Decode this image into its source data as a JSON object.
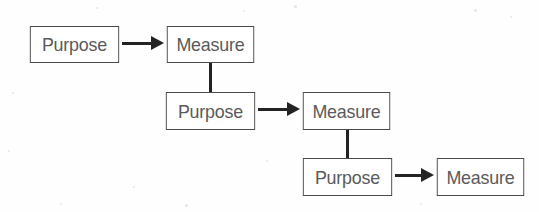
{
  "diagram": {
    "type": "flowchart",
    "colors": {
      "background": "#fefefe",
      "box_border": "#4a4a4a",
      "box_fill": "#ffffff",
      "text": "#5a5a5a",
      "connector": "#232323"
    },
    "nodes": [
      {
        "id": "purpose-1",
        "label": "Purpose",
        "row": 1,
        "x": 27,
        "y": 26,
        "w": 95,
        "h": 37
      },
      {
        "id": "measure-1",
        "label": "Measure",
        "row": 1,
        "x": 164,
        "y": 26,
        "w": 93,
        "h": 37
      },
      {
        "id": "purpose-2",
        "label": "Purpose",
        "row": 2,
        "x": 163,
        "y": 92,
        "w": 95,
        "h": 38
      },
      {
        "id": "measure-2",
        "label": "Measure",
        "row": 2,
        "x": 300,
        "y": 92,
        "w": 93,
        "h": 38
      },
      {
        "id": "purpose-3",
        "label": "Purpose",
        "row": 3,
        "x": 300,
        "y": 158,
        "w": 95,
        "h": 38
      },
      {
        "id": "measure-3",
        "label": "Measure",
        "row": 3,
        "x": 434,
        "y": 158,
        "w": 93,
        "h": 38
      }
    ],
    "connectors": [
      {
        "id": "arrow-purpose1-measure1",
        "kind": "arrow-right",
        "from": "purpose-1",
        "to": "measure-1",
        "x": 122,
        "y": 43,
        "length": 42
      },
      {
        "id": "link-measure1-purpose2",
        "kind": "line-vertical",
        "from": "measure-1",
        "to": "purpose-2",
        "x": 209,
        "y": 63,
        "length": 29
      },
      {
        "id": "arrow-purpose2-measure2",
        "kind": "arrow-right",
        "from": "purpose-2",
        "to": "measure-2",
        "x": 258,
        "y": 109,
        "length": 42
      },
      {
        "id": "link-measure2-purpose3",
        "kind": "line-vertical",
        "from": "measure-2",
        "to": "purpose-3",
        "x": 346,
        "y": 130,
        "length": 28
      },
      {
        "id": "arrow-purpose3-measure3",
        "kind": "arrow-right",
        "from": "purpose-3",
        "to": "measure-3",
        "x": 395,
        "y": 175,
        "length": 39
      }
    ],
    "speckles": [
      {
        "x": 96,
        "y": 7,
        "d": 2
      },
      {
        "x": 243,
        "y": 10,
        "d": 2
      },
      {
        "x": 294,
        "y": 5,
        "d": 3
      },
      {
        "x": 474,
        "y": 9,
        "d": 3
      },
      {
        "x": 510,
        "y": 16,
        "d": 2
      },
      {
        "x": 12,
        "y": 92,
        "d": 2
      },
      {
        "x": 8,
        "y": 150,
        "d": 2
      },
      {
        "x": 133,
        "y": 186,
        "d": 2
      },
      {
        "x": 60,
        "y": 203,
        "d": 2
      },
      {
        "x": 420,
        "y": 203,
        "d": 2
      },
      {
        "x": 266,
        "y": 160,
        "d": 2
      },
      {
        "x": 185,
        "y": 204,
        "d": 3
      }
    ]
  }
}
